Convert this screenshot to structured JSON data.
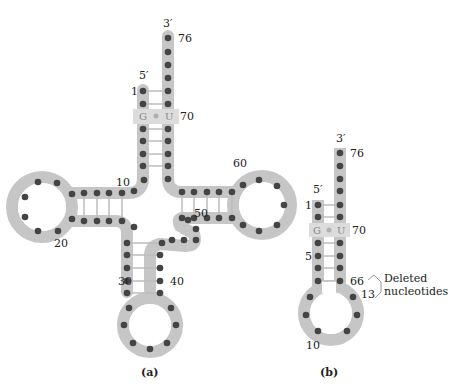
{
  "colors": {
    "backbone": "#c6c6c6",
    "nucleotide": "#444444",
    "pair_line": "#bdbdbd",
    "gu_box": "#dcdcdc",
    "text": "#222222"
  },
  "panel_a": {
    "caption": "(a)",
    "labels": {
      "three_prime": "3′",
      "five_prime": "5′",
      "n1": "1",
      "n10": "10",
      "n20": "20",
      "n30": "30",
      "n40": "40",
      "n50": "50",
      "n60": "60",
      "n70": "70",
      "n76": "76"
    },
    "wobble_pair": {
      "left": "G",
      "right": "U"
    }
  },
  "panel_b": {
    "caption": "(b)",
    "labels": {
      "three_prime": "3′",
      "five_prime": "5′",
      "n1": "1",
      "n5": "5",
      "n10": "10",
      "n13": "13",
      "n66": "66",
      "n70": "70",
      "n76": "76"
    },
    "wobble_pair": {
      "left": "G",
      "right": "U"
    },
    "annotation": {
      "line1": "Deleted",
      "line2": "nucleotides"
    }
  }
}
